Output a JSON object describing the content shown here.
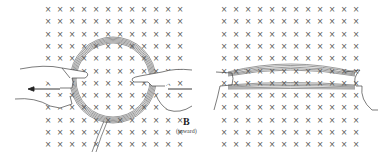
{
  "figure": {
    "left_panel": {
      "description": "circular wire loop held by two hands in magnetic field, pulled outward",
      "grid": {
        "cols": 12,
        "rows": 12,
        "x0": 48,
        "dx": 12,
        "y0": 9,
        "dy": 12.3,
        "symbol": "×"
      },
      "loop": {
        "cx": 113,
        "cy": 80,
        "r": 40
      },
      "arrows": [
        {
          "direction": "left",
          "x1": 60,
          "y1": 89,
          "x2": 28,
          "y2": 89
        },
        {
          "direction": "right",
          "x1": 168,
          "y1": 89,
          "x2": 192,
          "y2": 89
        }
      ]
    },
    "right_panel": {
      "description": "loop flattened into narrow ellipse after being pulled",
      "grid": {
        "cols": 12,
        "rows": 12,
        "x0": 224,
        "dx": 12,
        "y0": 9,
        "dy": 12.3,
        "symbol": "×"
      },
      "loop": {
        "cx": 290,
        "cy": 80,
        "rx": 64,
        "ry": 12
      }
    },
    "field_label": {
      "symbol": "B",
      "note": "(inward)"
    },
    "colors": {
      "ink": "#333333",
      "symbol": "#555555",
      "background": "#ffffff"
    }
  }
}
